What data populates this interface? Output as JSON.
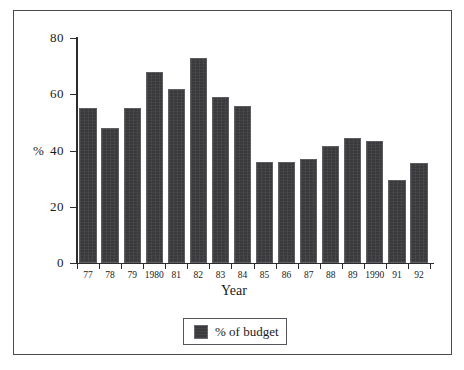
{
  "chart_data": {
    "type": "bar",
    "title": "",
    "subtitle": "",
    "xlabel": "Year",
    "ylabel": "%",
    "categories": [
      "77",
      "78",
      "79",
      "1980",
      "81",
      "82",
      "83",
      "84",
      "85",
      "86",
      "87",
      "88",
      "89",
      "1990",
      "91",
      "92"
    ],
    "values": [
      55,
      48,
      55,
      68,
      62,
      73,
      59,
      56,
      36,
      36,
      37,
      41.5,
      44.5,
      43.5,
      29.5,
      35.5
    ],
    "series": [
      {
        "name": "% of budget",
        "values": [
          55,
          48,
          55,
          68,
          62,
          73,
          59,
          56,
          36,
          36,
          37,
          41.5,
          44.5,
          43.5,
          29.5,
          35.5
        ]
      }
    ],
    "ylim": [
      0,
      80
    ],
    "ytick_labels": [
      "0",
      "20",
      "40",
      "60",
      "80"
    ],
    "ytick_values": [
      0,
      20,
      40,
      60,
      80
    ],
    "grid": false,
    "legend_position": "bottom-center",
    "legend_entries": [
      "% of budget"
    ],
    "bar_color": "#3a3a3c",
    "bar_edge_color": "#5e5e62",
    "frame_color": "#4a4a52",
    "axis_color": "#2c2c30",
    "background_color": "#ffffff"
  }
}
